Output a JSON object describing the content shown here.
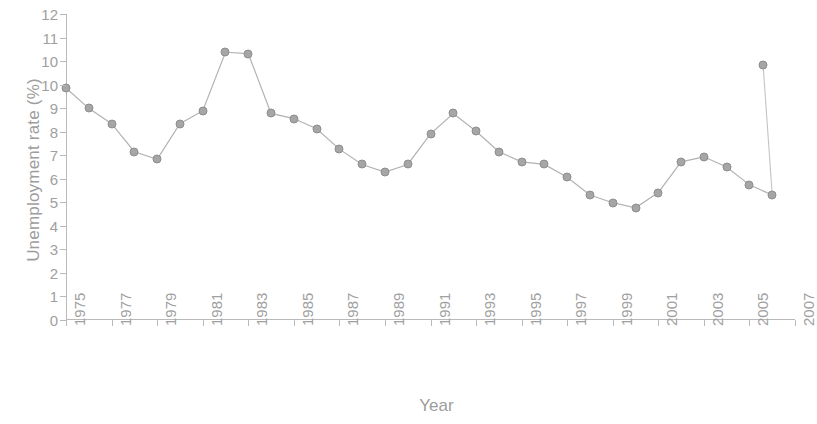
{
  "chart_data": {
    "type": "line",
    "title": "",
    "xlabel": "Year",
    "ylabel": "Unemployment rate (%)",
    "xlim": [
      1975,
      2007
    ],
    "ylim": [
      0,
      12
    ],
    "grid": false,
    "legend": "none",
    "marker": "filled-circle",
    "color": "#a6a6a6",
    "y_tick_labels": [
      "12",
      "11",
      "10",
      "10",
      "9",
      "8",
      "7",
      "6",
      "5",
      "4",
      "3",
      "2",
      "1",
      "0"
    ],
    "y_tick_values": [
      12,
      11,
      10,
      10,
      9,
      8,
      7,
      6,
      5,
      4,
      3,
      2,
      1,
      0
    ],
    "x_tick_labels": [
      "1975",
      "1977",
      "1979",
      "1981",
      "1983",
      "1985",
      "1987",
      "1989",
      "1991",
      "1993",
      "1995",
      "1997",
      "1999",
      "2001",
      "2003",
      "2005",
      "2007"
    ],
    "x_tick_values": [
      1975,
      1977,
      1979,
      1981,
      1983,
      1985,
      1987,
      1989,
      1991,
      1993,
      1995,
      1997,
      1999,
      2001,
      2003,
      2005,
      2007
    ],
    "x": [
      1975,
      1976,
      1977,
      1978,
      1979,
      1980,
      1981,
      1982,
      1983,
      1984,
      1985,
      1986,
      1987,
      1988,
      1989,
      1990,
      1991,
      1992,
      1993,
      1994,
      1995,
      1996,
      1997,
      1998,
      1999,
      2000,
      2001,
      2002,
      2003,
      2004,
      2005,
      2006
    ],
    "values": [
      9.1,
      8.3,
      7.7,
      6.6,
      6.3,
      7.7,
      8.2,
      10.5,
      10.45,
      8.1,
      7.9,
      7.5,
      6.7,
      6.1,
      5.8,
      6.1,
      7.3,
      8.1,
      7.4,
      6.6,
      6.2,
      6.1,
      5.6,
      4.9,
      4.6,
      4.4,
      5.0,
      6.2,
      6.4,
      6.0,
      5.3,
      4.9
    ],
    "series": [
      {
        "name": "Unemployment rate",
        "values": [
          9.1,
          8.3,
          7.7,
          6.6,
          6.3,
          7.7,
          8.2,
          10.5,
          10.45,
          8.1,
          7.9,
          7.5,
          6.7,
          6.1,
          5.8,
          6.1,
          7.3,
          8.1,
          7.4,
          6.6,
          6.2,
          6.1,
          5.6,
          4.9,
          4.6,
          4.4,
          5.0,
          6.2,
          6.4,
          6.0,
          5.3,
          4.9
        ]
      }
    ],
    "extra_points": [
      {
        "x": 2005.6,
        "y": 10.0,
        "note": "final detached point near right edge"
      }
    ]
  }
}
